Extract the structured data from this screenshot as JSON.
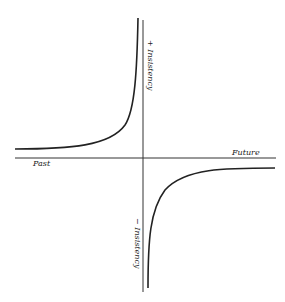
{
  "diagram": {
    "type": "hyperbola-axes",
    "horizontal_axis": {
      "left_label": "Past",
      "right_label": "Future"
    },
    "vertical_axis": {
      "top_label": "+ Insistency",
      "bottom_label": "− Insistency"
    },
    "curves": [
      {
        "name": "positive-insistency-curve",
        "quadrant": "upper-left"
      },
      {
        "name": "negative-insistency-curve",
        "quadrant": "lower-right"
      }
    ],
    "colors": {
      "ink": "#222222",
      "background": "#ffffff"
    }
  }
}
